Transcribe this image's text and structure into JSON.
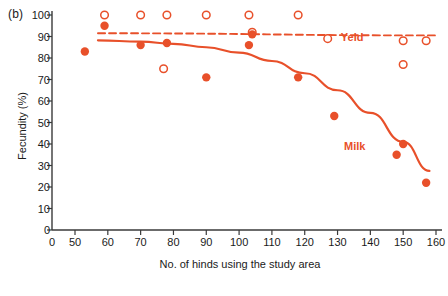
{
  "panel": {
    "label": "(b)"
  },
  "chart_data": {
    "type": "scatter",
    "title": "",
    "xlabel": "No. of hinds using the study area",
    "ylabel": "Fecundity  (%)",
    "xlim": [
      0,
      160
    ],
    "ylim": [
      0,
      100
    ],
    "grid": false,
    "legend_position": "inline-annotation",
    "axis_break": "x axis jumps from 0 to 50",
    "xticks": [
      0,
      50,
      60,
      70,
      80,
      90,
      100,
      110,
      120,
      130,
      140,
      150,
      160
    ],
    "yticks": [
      0,
      10,
      20,
      30,
      40,
      50,
      60,
      70,
      80,
      90,
      100
    ],
    "accent_color": "#E8502A",
    "axis_color": "#3a3a3a",
    "series": [
      {
        "name": "Yeld",
        "marker": "open-circle",
        "line_style": "dashed",
        "label_text": "Yeld",
        "points": [
          {
            "x": 59,
            "y": 100
          },
          {
            "x": 70,
            "y": 100
          },
          {
            "x": 77,
            "y": 75
          },
          {
            "x": 78,
            "y": 100
          },
          {
            "x": 90,
            "y": 100
          },
          {
            "x": 103,
            "y": 100
          },
          {
            "x": 104,
            "y": 92
          },
          {
            "x": 118,
            "y": 100
          },
          {
            "x": 127,
            "y": 89
          },
          {
            "x": 150,
            "y": 88
          },
          {
            "x": 150,
            "y": 77
          },
          {
            "x": 157,
            "y": 88
          }
        ],
        "fit_line": [
          {
            "x": 57,
            "y": 91.5
          },
          {
            "x": 160,
            "y": 90.5
          }
        ]
      },
      {
        "name": "Milk",
        "marker": "filled-circle",
        "line_style": "solid",
        "label_text": "Milk",
        "points": [
          {
            "x": 53,
            "y": 83
          },
          {
            "x": 59,
            "y": 95
          },
          {
            "x": 70,
            "y": 86
          },
          {
            "x": 78,
            "y": 87
          },
          {
            "x": 90,
            "y": 71
          },
          {
            "x": 103,
            "y": 86
          },
          {
            "x": 104,
            "y": 91
          },
          {
            "x": 118,
            "y": 71
          },
          {
            "x": 129,
            "y": 53
          },
          {
            "x": 148,
            "y": 35
          },
          {
            "x": 150,
            "y": 40
          },
          {
            "x": 157,
            "y": 22
          }
        ],
        "fit_line": [
          {
            "x": 57,
            "y": 88.2
          },
          {
            "x": 70,
            "y": 87.6
          },
          {
            "x": 80,
            "y": 86.6
          },
          {
            "x": 90,
            "y": 85.0
          },
          {
            "x": 100,
            "y": 82.5
          },
          {
            "x": 110,
            "y": 78.6
          },
          {
            "x": 120,
            "y": 72.9
          },
          {
            "x": 130,
            "y": 65.0
          },
          {
            "x": 140,
            "y": 54.5
          },
          {
            "x": 150,
            "y": 41.0
          },
          {
            "x": 158,
            "y": 27.5
          }
        ]
      }
    ],
    "annotations": [
      {
        "text": "Yeld",
        "x": 131,
        "y": 89.5
      },
      {
        "text": "Milk",
        "x": 132,
        "y": 38.5
      }
    ]
  }
}
